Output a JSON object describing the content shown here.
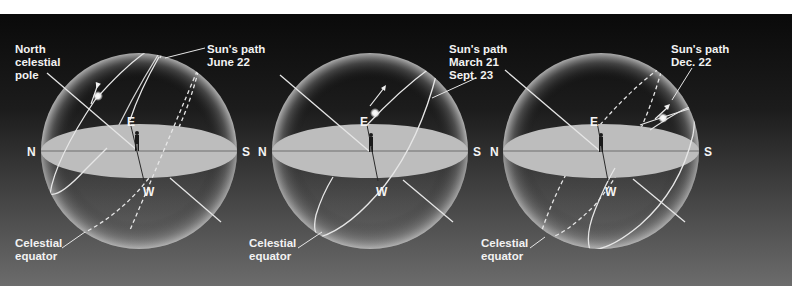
{
  "figure": {
    "panels": [
      {
        "id": "june",
        "labels": {
          "pole_line1": "North",
          "pole_line2": "celestial",
          "pole_line3": "pole",
          "path_line1": "Sun's path",
          "path_line2": "June 22",
          "equator_line1": "Celestial",
          "equator_line2": "equator"
        },
        "directions": {
          "north": "N",
          "south": "S",
          "east": "E",
          "west": "W"
        }
      },
      {
        "id": "equinox",
        "labels": {
          "path_line1": "Sun's path",
          "path_line2": "March 21",
          "path_line3": "Sept. 23",
          "equator_line1": "Celestial",
          "equator_line2": "equator"
        },
        "directions": {
          "north": "N",
          "south": "S",
          "east": "E",
          "west": "W"
        }
      },
      {
        "id": "december",
        "labels": {
          "path_line1": "Sun's path",
          "path_line2": "Dec. 22",
          "equator_line1": "Celestial",
          "equator_line2": "equator"
        },
        "directions": {
          "north": "N",
          "south": "S",
          "east": "E",
          "west": "W"
        }
      }
    ],
    "colors": {
      "background_top": "#0c0c0c",
      "background_bottom": "#6a6a6a",
      "horizon_fill": "#bdbdbd",
      "line": "#e6e6e6",
      "label": "#f2f2f2"
    }
  }
}
